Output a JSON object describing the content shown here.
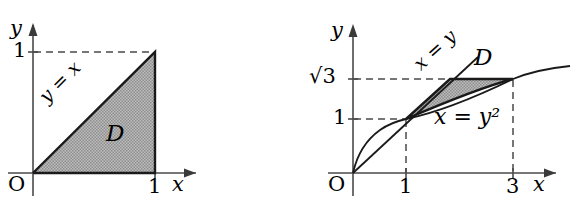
{
  "figure": {
    "type": "math-diagram",
    "background_color": "#ffffff",
    "shade_color": "#a8a8a8",
    "line_color": "#1a1a1a",
    "axis_color": "#4a4a4a"
  },
  "panels": [
    {
      "id": "left",
      "origin_label": "O",
      "x_axis_label": "x",
      "y_axis_label": "y",
      "x_ticks": [
        {
          "value": 1,
          "label": "1"
        }
      ],
      "y_ticks": [
        {
          "value": 1,
          "label": "1"
        }
      ],
      "region_label": "D",
      "curve_labels": [
        {
          "text": "y = x",
          "rotation": -45
        }
      ],
      "region_vertices": [
        [
          0,
          0
        ],
        [
          1,
          0
        ],
        [
          1,
          1
        ]
      ],
      "dashed_guides": [
        {
          "from": [
            0,
            1
          ],
          "to": [
            1,
            1
          ]
        },
        {
          "from": [
            1,
            1
          ],
          "to": [
            1,
            0
          ]
        }
      ]
    },
    {
      "id": "right",
      "origin_label": "O",
      "x_axis_label": "x",
      "y_axis_label": "y",
      "x_ticks": [
        {
          "value": 1,
          "label": "1"
        },
        {
          "value": 3,
          "label": "3"
        }
      ],
      "y_ticks": [
        {
          "value": 1,
          "label": "1"
        },
        {
          "value": 1.732,
          "label": "√3"
        }
      ],
      "region_label": "D",
      "curve_labels": [
        {
          "text": "x = y",
          "rotation": -42
        },
        {
          "text": "x = y²",
          "rotation": 0
        }
      ],
      "region_vertices": [
        [
          1,
          1
        ],
        [
          1.732,
          1.732
        ],
        [
          3,
          1.732
        ],
        [
          3,
          1.732
        ]
      ],
      "region_boundaries": [
        "x = y",
        "x = y²",
        "y = √3"
      ],
      "dashed_guides": [
        {
          "from": [
            0,
            1.732
          ],
          "to": [
            3,
            1.732
          ]
        },
        {
          "from": [
            0,
            1
          ],
          "to": [
            1,
            1
          ]
        },
        {
          "from": [
            1,
            1
          ],
          "to": [
            1,
            0
          ]
        },
        {
          "from": [
            3,
            1.732
          ],
          "to": [
            3,
            0
          ]
        }
      ]
    }
  ]
}
